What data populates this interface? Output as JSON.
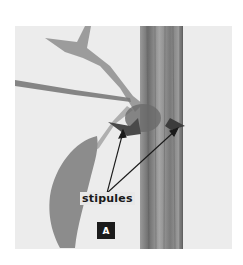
{
  "figure": {
    "annotation_label": "stipules",
    "panel_letter": "A",
    "colors": {
      "background": "#ececec",
      "stem": "#8a8a8a",
      "leaf": "#8c8c8c",
      "arrow": "#1a1a1a",
      "badge": "#1b1b1b"
    }
  }
}
